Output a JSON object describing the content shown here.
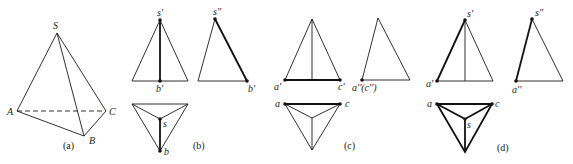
{
  "figure": {
    "type": "orthographic projection of triangular pyramid S-ABC",
    "colors": {
      "line": "#1a1a1a",
      "background": "#ffffff"
    }
  },
  "panels": {
    "a": {
      "caption": "(a)",
      "labels": {
        "S": "S",
        "A": "A",
        "B": "B",
        "C": "C"
      }
    },
    "b": {
      "caption": "(b)",
      "front_labels": {
        "apex": "s'",
        "base": "b'"
      },
      "side_labels": {
        "apex": "s''",
        "base": "b'"
      },
      "top_labels": {
        "apex": "s",
        "base": "b"
      }
    },
    "c": {
      "caption": "(c)",
      "front_labels": {
        "left": "a'",
        "right": "c'"
      },
      "side_labels": {
        "left": "a''(c'')"
      },
      "top_labels": {
        "left": "a",
        "right": "c"
      }
    },
    "d": {
      "caption": "(d)",
      "front_labels": {
        "apex": "s'",
        "left": "a'"
      },
      "side_labels": {
        "apex": "s''",
        "left": "a''"
      },
      "top_labels": {
        "left": "a",
        "right": "c",
        "apex": "s"
      }
    }
  }
}
